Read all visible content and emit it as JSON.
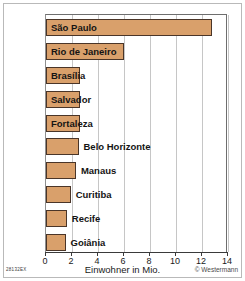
{
  "chart_data": {
    "type": "bar",
    "orientation": "horizontal",
    "title": "",
    "xlabel": "Einwohner in Mio.",
    "ylabel": "",
    "xlim": [
      0,
      14
    ],
    "xticks": [
      0,
      2,
      4,
      6,
      8,
      10,
      12,
      14
    ],
    "grid": true,
    "legend": null,
    "categories": [
      "São Paulo",
      "Rio de Janeiro",
      "Brasília",
      "Salvador",
      "Fortaleza",
      "Belo Horizonte",
      "Manaus",
      "Curitiba",
      "Recife",
      "Goiânia"
    ],
    "values": [
      12.8,
      6.0,
      2.6,
      2.6,
      2.6,
      2.5,
      2.3,
      1.9,
      1.6,
      1.5
    ],
    "label_placement": [
      "inside",
      "inside",
      "inside",
      "inside",
      "inside",
      "outside",
      "outside",
      "outside",
      "outside",
      "outside"
    ]
  },
  "figure": {
    "credit": "© Westermann",
    "code": "28132EX"
  },
  "colors": {
    "bar_fill": "#d9a06b",
    "bar_border": "#4a3528",
    "gridline": "#c6c6c6",
    "axis": "#3a3a3a",
    "frame": "#b9b9b9",
    "background": "#ffffff"
  }
}
